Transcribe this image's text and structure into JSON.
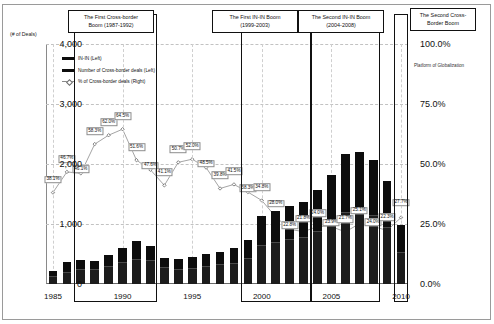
{
  "chart_data": {
    "type": "bar",
    "title": "",
    "xlabel": "",
    "ylabel": "(# of Deals)",
    "ylabel_right": "",
    "ylim": [
      0,
      4000
    ],
    "ylim_right": [
      0,
      100
    ],
    "grid": true,
    "legend_position": "upper-left",
    "x": [
      1985,
      1986,
      1987,
      1988,
      1989,
      1990,
      1991,
      1992,
      1993,
      1994,
      1995,
      1996,
      1997,
      1998,
      1999,
      2000,
      2001,
      2002,
      2003,
      2004,
      2005,
      2006,
      2007,
      2008,
      2009,
      2010
    ],
    "xticks": [
      "1985",
      "1990",
      "1995",
      "2000",
      "2005",
      "2010"
    ],
    "yticks_left": [
      "0",
      "1,000",
      "2,000",
      "3,000",
      "4,000"
    ],
    "yticks_right": [
      "0.0%",
      "25.0%",
      "50.0%",
      "75.0%",
      "100.0%"
    ],
    "series": [
      {
        "name": "Number of Cross-border deals (Left)",
        "axis": "left",
        "type": "bar-segment",
        "values": [
          210,
          360,
          400,
          390,
          490,
          600,
          720,
          640,
          440,
          420,
          450,
          500,
          540,
          600,
          740,
          1130,
          1220,
          1300,
          1370,
          1570,
          1820,
          2160,
          2200,
          2060,
          1710,
          980
        ]
      },
      {
        "name": "IN-IN (Left)",
        "axis": "left",
        "type": "bar-segment",
        "values": [
          130,
          200,
          240,
          250,
          300,
          360,
          410,
          390,
          270,
          250,
          260,
          290,
          320,
          350,
          430,
          640,
          700,
          740,
          770,
          880,
          1020,
          1200,
          1220,
          1140,
          950,
          520
        ]
      },
      {
        "name": "% of Cross-border deals (Right)",
        "axis": "right",
        "type": "line",
        "values": [
          38.1,
          46.7,
          46.1,
          58.3,
          62.0,
          64.5,
          51.6,
          47.6,
          41.1,
          50.7,
          52.0,
          48.5,
          39.8,
          41.5,
          38.3,
          34.8,
          28.0,
          22.8,
          21.8,
          24.0,
          23.9,
          21.7,
          25.1,
          24.0,
          22.3,
          27.7
        ]
      }
    ],
    "point_labels": [
      "38.1%",
      "46.7%",
      "46.1%",
      "58.3%",
      "62.0%",
      "64.5%",
      "51.6%",
      "47.6%",
      "41.1%",
      "50.7%",
      "52.0%",
      "48.5%",
      "39.8%",
      "41.5%",
      "38.3%",
      "34.8%",
      "28.0%",
      "22.8%",
      "21.8%",
      "24.0%",
      "23.9%",
      "21.7%",
      "25.1%",
      "24.0%",
      "22.3%",
      "27.7%"
    ],
    "annotations": [
      {
        "name": "first-cross-border-boom",
        "line1": "The First Cross-border",
        "line2": "Boom (1987-1992)",
        "start_year": 1987,
        "end_year": 1992
      },
      {
        "name": "first-in-in-boom",
        "line1": "The First IN-IN Boom",
        "line2": "(1999-2003)",
        "start_year": 1999,
        "end_year": 2003
      },
      {
        "name": "second-in-in-boom",
        "line1": "The Second IN-IN Boom",
        "line2": "(2004-2008)",
        "start_year": 2004,
        "end_year": 2008
      },
      {
        "name": "second-cross-border-boom",
        "line1": "The Second Cross-",
        "line2": "Border Boom",
        "start_year": 2010,
        "end_year": 2010
      }
    ],
    "notes": [
      {
        "name": "platform-note",
        "text": "Platform of Globalization"
      }
    ]
  },
  "legend": {
    "items": [
      {
        "label": "IN-IN (Left)",
        "style": "bar"
      },
      {
        "label": "Number of Cross-border deals (Left)",
        "style": "bar"
      },
      {
        "label": "% of Cross-border deals (Right)",
        "style": "line"
      }
    ]
  },
  "axes": {
    "left_units": "(# of Deals)"
  }
}
